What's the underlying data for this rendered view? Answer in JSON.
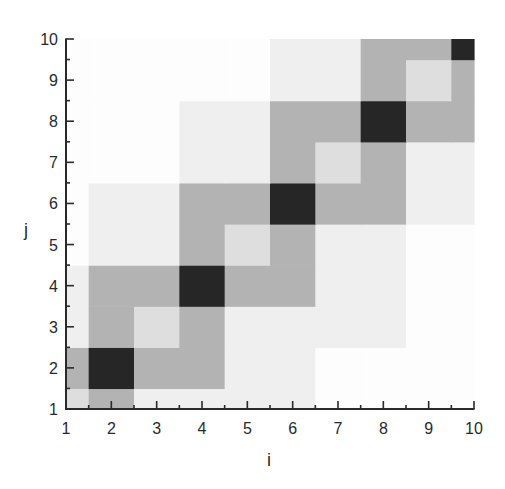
{
  "chart_data": {
    "type": "heatmap",
    "title": "",
    "xlabel": "i",
    "ylabel": "j",
    "xlim": [
      1,
      10
    ],
    "ylim": [
      1,
      10
    ],
    "x": [
      1,
      2,
      3,
      4,
      5,
      6,
      7,
      8,
      9,
      10
    ],
    "y": [
      1,
      2,
      3,
      4,
      5,
      6,
      7,
      8,
      9,
      10
    ],
    "x_tick_labels": [
      "1",
      "2",
      "3",
      "4",
      "5",
      "6",
      "7",
      "8",
      "9",
      "10"
    ],
    "y_tick_labels": [
      "1",
      "2",
      "3",
      "4",
      "5",
      "6",
      "7",
      "8",
      "9",
      "10"
    ],
    "grid": false,
    "legend": null,
    "colormap": "grayscale (0 = white, 4 = black)",
    "level_colors": [
      "#fdfdfd",
      "#efefef",
      "#dedede",
      "#b3b3b3",
      "#262626"
    ],
    "values_note": "values[row] where row 0 is j=1 ... row 9 is j=10; columns i=1..10; relative intensity levels 0-4",
    "values": [
      [
        2,
        3,
        1,
        1,
        1,
        1,
        0,
        0,
        0,
        0
      ],
      [
        3,
        4,
        3,
        3,
        1,
        1,
        0,
        0,
        0,
        0
      ],
      [
        1,
        3,
        2,
        3,
        1,
        1,
        1,
        1,
        0,
        0
      ],
      [
        1,
        3,
        3,
        4,
        3,
        3,
        1,
        1,
        0,
        0
      ],
      [
        0,
        1,
        1,
        3,
        2,
        3,
        1,
        1,
        0,
        0
      ],
      [
        0,
        1,
        1,
        3,
        3,
        4,
        3,
        3,
        1,
        1
      ],
      [
        0,
        0,
        0,
        1,
        1,
        3,
        2,
        3,
        1,
        1
      ],
      [
        0,
        0,
        0,
        1,
        1,
        3,
        3,
        4,
        3,
        3
      ],
      [
        0,
        0,
        0,
        0,
        0,
        1,
        1,
        3,
        2,
        3
      ],
      [
        0,
        0,
        0,
        0,
        0,
        1,
        1,
        3,
        3,
        4
      ]
    ]
  }
}
